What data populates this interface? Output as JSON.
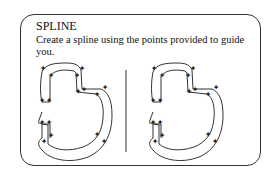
{
  "card": {
    "title": "SPLINE",
    "instruction": "Create a spline using the points provided to guide you."
  },
  "panels": [
    {
      "name": "example",
      "label": "Example spline with control points"
    },
    {
      "name": "practice",
      "label": "Practice spline with control points"
    }
  ],
  "colors": {
    "stroke": "#333333",
    "border": "#333333",
    "background": "#ffffff"
  }
}
